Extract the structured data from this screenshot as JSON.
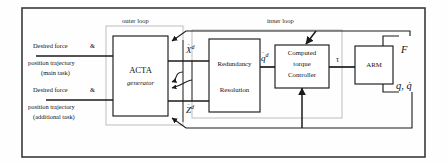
{
  "diagram": {
    "type": "control-block-diagram",
    "colors": {
      "line": "#1a1a1a",
      "loop_box": "#b9b9b9",
      "frame": "#3a3a3a",
      "text": "#111111",
      "background": "#fefefe"
    }
  },
  "loops": {
    "outer": "outer loop",
    "inner": "inner loop"
  },
  "inputs": {
    "main_task": {
      "line1": "Desired force",
      "amp": "&",
      "line2": "position trajectory",
      "line3": "(main task)"
    },
    "additional_task": {
      "line1": "Desired force",
      "amp": "&",
      "line2": "position trajectory",
      "line3": "(additional task)"
    }
  },
  "blocks": [
    {
      "id": "acta",
      "line1": "ACTA",
      "line2": "generator"
    },
    {
      "id": "redundancy",
      "line1": "Redundancy",
      "line2": "Resolution"
    },
    {
      "id": "controller",
      "line1": "Computed",
      "line2": "torque",
      "line3": "Controller"
    },
    {
      "id": "arm",
      "line1": "ARM"
    }
  ],
  "signals": {
    "x_ddot_d": {
      "base": "X",
      "dots": "¨",
      "sup": "d"
    },
    "z_ddot_d": {
      "base": "Z",
      "dots": "¨",
      "sup": "d"
    },
    "q_ddot_d": {
      "base": "q",
      "dots": "¨",
      "sup": "d"
    },
    "tau": "τ",
    "force": "F",
    "joint_state": {
      "q": "q",
      "sep": ", ",
      "qdot": "q̇"
    }
  }
}
